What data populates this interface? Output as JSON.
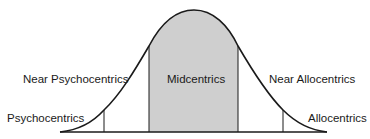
{
  "diagram": {
    "type": "normal-distribution-curve",
    "segments": [
      {
        "id": "psychocentrics",
        "label": "Psychocentrics"
      },
      {
        "id": "near-psychocentrics",
        "label": "Near Psychocentrics"
      },
      {
        "id": "midcentrics",
        "label": "Midcentrics",
        "shaded": true
      },
      {
        "id": "near-allocentrics",
        "label": "Near Allocentrics"
      },
      {
        "id": "allocentrics",
        "label": "Allocentrics"
      }
    ],
    "colors": {
      "stroke": "#1a1a1a",
      "shaded_fill": "#cfcfcf",
      "background": "#ffffff"
    }
  }
}
